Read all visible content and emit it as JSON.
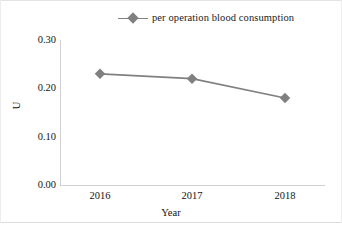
{
  "chart_data": {
    "type": "line",
    "title": "",
    "categories": [
      "2016",
      "2017",
      "2018"
    ],
    "series": [
      {
        "name": "per operation blood consumption",
        "values": [
          0.23,
          0.22,
          0.18
        ],
        "color": "#808080",
        "marker": "diamond"
      }
    ],
    "xlabel": "Year",
    "ylabel": "U",
    "ylim": [
      0.0,
      0.3
    ],
    "ytick_labels": [
      "0.00",
      "0.10",
      "0.20",
      "0.30"
    ],
    "ytick_values": [
      0.0,
      0.1,
      0.2,
      0.3
    ],
    "grid": false,
    "legend_position": "top-center"
  },
  "legend": {
    "entries": [
      {
        "label": "per operation blood consumption",
        "color": "#808080"
      }
    ]
  },
  "axes": {
    "y": {
      "label": "U",
      "ticks": [
        "0.30",
        "0.20",
        "0.10",
        "0.00"
      ]
    },
    "x": {
      "label": "Year",
      "ticks": [
        "2016",
        "2017",
        "2018"
      ]
    }
  },
  "colors": {
    "series": "#808080",
    "axis": "#d0d0d0",
    "text": "#141414",
    "background": "#ffffff"
  }
}
